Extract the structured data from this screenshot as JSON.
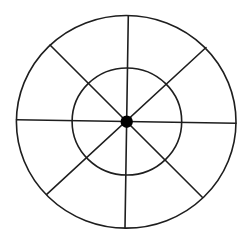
{
  "diagram": {
    "type": "concentric-circles-with-radial-spokes",
    "background": "#ffffff",
    "stroke_color": "#1e1e1e",
    "outer_circle": {
      "cx": 126.2,
      "cy": 121.8,
      "rx": 109.8,
      "ry": 106.3
    },
    "inner_circle": {
      "cx": 126.9,
      "cy": 121.5,
      "rx": 54.8,
      "ry": 53.5
    },
    "center_dot": {
      "cx": 126.7,
      "cy": 121.7,
      "r": 6.2,
      "color": "#000000"
    },
    "spokes": [
      {
        "name": "vertical",
        "x1": 128.3,
        "y1": 15.8,
        "x2": 125.0,
        "y2": 228.0
      },
      {
        "name": "horizontal",
        "x1": 16.5,
        "y1": 119.8,
        "x2": 236.0,
        "y2": 123.2
      },
      {
        "name": "diagonal-tl-br",
        "x1": 50.0,
        "y1": 45.0,
        "x2": 202.3,
        "y2": 197.3
      },
      {
        "name": "diagonal-tr-bl",
        "x1": 206.0,
        "y1": 47.5,
        "x2": 46.7,
        "y2": 194.3
      }
    ],
    "segment_count": 8,
    "ring_count": 2
  }
}
